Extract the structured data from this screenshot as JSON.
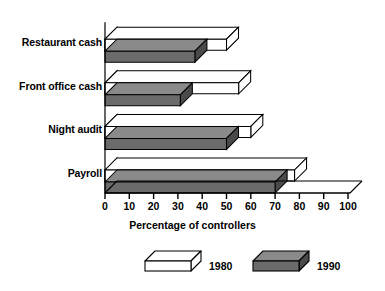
{
  "chart_data": {
    "type": "bar",
    "orientation": "horizontal",
    "style": "3d-isometric",
    "title": "",
    "xlabel": "Percentage of controllers",
    "ylabel": "",
    "categories": [
      "Restaurant cash",
      "Front office cash",
      "Night audit",
      "Payroll"
    ],
    "series": [
      {
        "name": "1980",
        "values": [
          50,
          55,
          60,
          78
        ],
        "color": "#ffffff"
      },
      {
        "name": "1990",
        "values": [
          37,
          31,
          50,
          70
        ],
        "color": "#6b6b6b"
      }
    ],
    "xlim": [
      0,
      100
    ],
    "xticks": [
      0,
      10,
      20,
      30,
      40,
      50,
      60,
      70,
      80,
      90,
      100
    ],
    "xtick_labels": [
      "0",
      "10",
      "20",
      "30",
      "40",
      "50",
      "60",
      "70",
      "80",
      "90",
      "100"
    ],
    "grid": false,
    "legend_position": "bottom"
  },
  "axis": {
    "title": "Percentage of controllers",
    "ticks": [
      "0",
      "10",
      "20",
      "30",
      "40",
      "50",
      "60",
      "70",
      "80",
      "90",
      "100"
    ]
  },
  "categories": [
    {
      "label": "Restaurant cash"
    },
    {
      "label": "Front office cash"
    },
    {
      "label": "Night audit"
    },
    {
      "label": "Payroll"
    }
  ],
  "legend": [
    {
      "label": "1980",
      "swatch": "white-3d-box"
    },
    {
      "label": "1990",
      "swatch": "gray-3d-box"
    }
  ],
  "colors": {
    "series_1980": "#ffffff",
    "series_1990": "#6b6b6b",
    "outline": "#000000",
    "background": "#ffffff",
    "gray_top": "#8a8a8a",
    "gray_side": "#4a4a4a"
  }
}
